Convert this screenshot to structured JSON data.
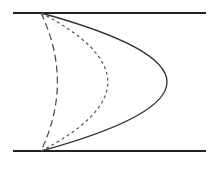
{
  "diagram": {
    "title": "",
    "elements": [
      {
        "id": "top-plate",
        "kind": "wall"
      },
      {
        "id": "bottom-plate",
        "kind": "wall"
      },
      {
        "id": "profile-solid",
        "kind": "velocity-profile",
        "style": "solid",
        "relative_peak": 1.0
      },
      {
        "id": "profile-short-dash",
        "kind": "velocity-profile",
        "style": "short-dashed",
        "relative_peak": 0.53
      },
      {
        "id": "profile-long-dash",
        "kind": "velocity-profile",
        "style": "long-dashed",
        "relative_peak": 0.13
      }
    ],
    "colors": {
      "line": "#222222",
      "background": "#ffffff"
    }
  }
}
